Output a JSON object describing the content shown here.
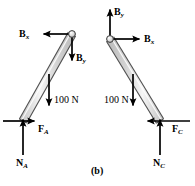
{
  "figure": {
    "caption": "(b)",
    "background_color": "#ffffff",
    "ink_color": "#000000",
    "bar_fill_color": "#dcdcdc",
    "bar_highlight_color": "#f4f4f4",
    "bar_stroke_color": "#3a3a3a"
  },
  "diagrams": [
    {
      "name": "left-free-body-diagram",
      "description": "Leaning bar pinned at upper right, resting on ground at lower left",
      "pivot": {
        "x": 72,
        "y": 34
      },
      "base": {
        "x": 23,
        "y": 121
      },
      "forces": [
        {
          "id": "left-bx",
          "label": "B",
          "subscript": "x",
          "direction": "left",
          "tail": {
            "x": 72,
            "y": 34
          },
          "head": {
            "x": 42,
            "y": 34
          },
          "label_x": 19,
          "label_y": 29
        },
        {
          "id": "left-by",
          "label": "B",
          "subscript": "y",
          "direction": "down",
          "tail": {
            "x": 72,
            "y": 34
          },
          "head": {
            "x": 72,
            "y": 62
          },
          "label_x": 76,
          "label_y": 53
        },
        {
          "id": "left-weight",
          "label": "100 N",
          "subscript": "",
          "direction": "down",
          "tail": {
            "x": 49,
            "y": 74
          },
          "head": {
            "x": 49,
            "y": 107
          },
          "label_x": 54,
          "label_y": 95
        },
        {
          "id": "left-friction",
          "label": "F",
          "subscript": "A",
          "direction": "right",
          "tail": {
            "x": 3,
            "y": 121
          },
          "head": {
            "x": 36,
            "y": 121
          },
          "label_x": 38,
          "label_y": 124
        },
        {
          "id": "left-normal",
          "label": "N",
          "subscript": "A",
          "direction": "up",
          "tail": {
            "x": 23,
            "y": 155
          },
          "head": {
            "x": 23,
            "y": 118
          },
          "label_x": 16,
          "label_y": 158
        }
      ]
    },
    {
      "name": "right-free-body-diagram",
      "description": "Leaning bar pinned at upper left, resting on ground at lower right",
      "pivot": {
        "x": 110,
        "y": 39
      },
      "base": {
        "x": 160,
        "y": 121
      },
      "forces": [
        {
          "id": "right-by",
          "label": "B",
          "subscript": "y",
          "direction": "up",
          "tail": {
            "x": 110,
            "y": 39
          },
          "head": {
            "x": 110,
            "y": 8
          },
          "label_x": 114,
          "label_y": 7
        },
        {
          "id": "right-bx",
          "label": "B",
          "subscript": "x",
          "direction": "right",
          "tail": {
            "x": 110,
            "y": 39
          },
          "head": {
            "x": 141,
            "y": 39
          },
          "label_x": 144,
          "label_y": 34
        },
        {
          "id": "right-weight",
          "label": "100 N",
          "subscript": "",
          "direction": "down",
          "tail": {
            "x": 133,
            "y": 74
          },
          "head": {
            "x": 133,
            "y": 107
          },
          "label_x": 104,
          "label_y": 95
        },
        {
          "id": "right-friction",
          "label": "F",
          "subscript": "C",
          "direction": "left",
          "tail": {
            "x": 190,
            "y": 121
          },
          "head": {
            "x": 146,
            "y": 121
          },
          "label_x": 172,
          "label_y": 124
        },
        {
          "id": "right-normal",
          "label": "N",
          "subscript": "C",
          "direction": "up",
          "tail": {
            "x": 160,
            "y": 155
          },
          "head": {
            "x": 160,
            "y": 118
          },
          "label_x": 153,
          "label_y": 158
        }
      ]
    }
  ]
}
